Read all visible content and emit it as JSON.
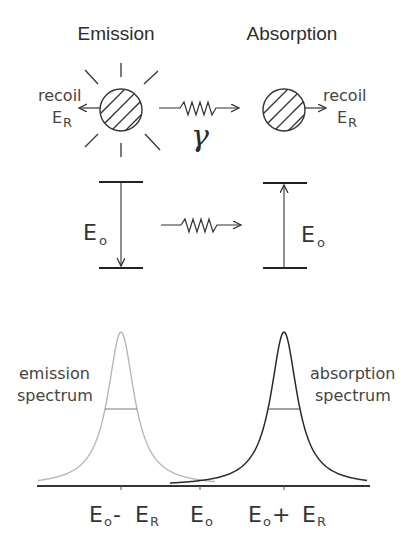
{
  "headings": {
    "emission": "Emission",
    "absorption": "Absorption"
  },
  "top": {
    "emitter": {
      "recoil_label": "recoil",
      "energy_symbol": "E",
      "energy_subscript": "R",
      "recoil_direction": "left",
      "rays": 8
    },
    "absorber": {
      "recoil_label": "recoil",
      "energy_symbol": "E",
      "energy_subscript": "R",
      "recoil_direction": "right"
    },
    "photon_symbol": "γ"
  },
  "levels": {
    "emission": {
      "symbol": "E",
      "subscript": "o",
      "transition": "down"
    },
    "absorption": {
      "symbol": "E",
      "subscript": "o",
      "transition": "up"
    }
  },
  "spectra": {
    "emission_label_line1": "emission",
    "emission_label_line2": "spectrum",
    "absorption_label_line1": "absorption",
    "absorption_label_line2": "spectrum",
    "emission_color": "#b8b8b8",
    "absorption_color": "#2a2a2a",
    "axis_color": "#333333"
  },
  "axis_labels": [
    {
      "main": "E",
      "sub1": "o",
      "op": " - ",
      "main2": "E",
      "sub2": "R"
    },
    {
      "main": "E",
      "sub1": "o"
    },
    {
      "main": "E",
      "sub1": "o",
      "op": " + ",
      "main2": "E",
      "sub2": "R"
    }
  ],
  "chart_data": {
    "type": "line",
    "title": "",
    "xlabel": "",
    "ylabel": "",
    "x_ticks": [
      "Eo - ER",
      "Eo",
      "Eo + ER"
    ],
    "series": [
      {
        "name": "emission spectrum",
        "shape": "lorentzian",
        "center": "Eo - ER",
        "relative_height": 1.0,
        "half_max_marked": true,
        "color": "#b8b8b8"
      },
      {
        "name": "absorption spectrum",
        "shape": "lorentzian",
        "center": "Eo + ER",
        "relative_height": 1.0,
        "half_max_marked": true,
        "color": "#2a2a2a"
      }
    ],
    "grid": false,
    "legend": "inline labels"
  }
}
